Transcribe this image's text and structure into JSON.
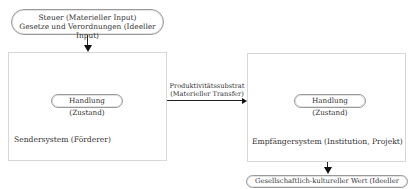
{
  "input_pill": {
    "line1": "Steuer (Materieller Input)",
    "line2": "Gesetze und Verordnungen (Ideeller Input)"
  },
  "sender": {
    "state_label": "Handlung (Zustand)",
    "system_label": "Sendersystem (Förderer)"
  },
  "transfer": {
    "line1": "Produktivitätssubstrat",
    "line2": "(Materieller Transfer)"
  },
  "receiver": {
    "state_label": "Handlung (Zustand)",
    "system_label": "Empfängersystem (Institution, Projekt)"
  },
  "output_pill": {
    "label": "Gesellschaftlich-kultureller Wert (Ideeller Output)"
  }
}
